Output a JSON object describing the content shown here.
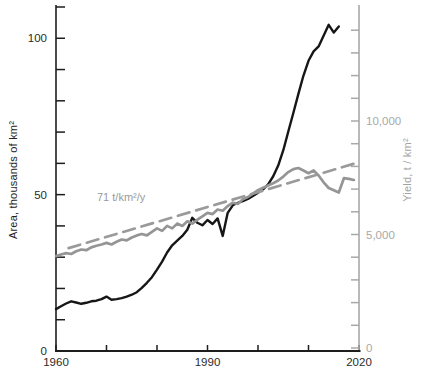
{
  "chart_data": {
    "type": "line",
    "title": "",
    "grid": false,
    "legend": "none",
    "annotation": {
      "text": "71 t/km²/y",
      "color": "#9a9a9a"
    },
    "x_axis": {
      "range": [
        1960,
        2020
      ],
      "tick_step": 10,
      "labeled_ticks": [
        1960,
        1990,
        2020
      ],
      "tick_labels": [
        "1960",
        "1990",
        "2020"
      ],
      "color": "#1d1d1d"
    },
    "left_axis": {
      "label": "Area, thousands of km²",
      "range": [
        0,
        110
      ],
      "tick_step": 10,
      "labeled_ticks": [
        0,
        50,
        100
      ],
      "tick_labels": [
        "0",
        "50",
        "100"
      ],
      "color": "#1d1d1d"
    },
    "right_axis": {
      "label": "Yield, t / km²",
      "range": [
        0,
        14000
      ],
      "tick_step": 1000,
      "labeled_ticks": [
        0,
        5000,
        10000
      ],
      "tick_labels": [
        "0",
        "5,000",
        "10,000"
      ],
      "color": "#a8a8a8"
    },
    "series": [
      {
        "name": "Area, thousands of km2",
        "axis": "left",
        "color": "#161616",
        "style": "solid",
        "width": 2.4,
        "points": [
          [
            1960,
            13.4
          ],
          [
            1961,
            14.3
          ],
          [
            1962,
            15.2
          ],
          [
            1963,
            15.9
          ],
          [
            1964,
            15.5
          ],
          [
            1965,
            15.1
          ],
          [
            1966,
            15.4
          ],
          [
            1967,
            15.9
          ],
          [
            1968,
            16.1
          ],
          [
            1969,
            16.6
          ],
          [
            1970,
            17.4
          ],
          [
            1971,
            16.4
          ],
          [
            1972,
            16.6
          ],
          [
            1973,
            16.9
          ],
          [
            1974,
            17.4
          ],
          [
            1975,
            18.0
          ],
          [
            1976,
            18.8
          ],
          [
            1977,
            20.2
          ],
          [
            1978,
            21.8
          ],
          [
            1979,
            23.6
          ],
          [
            1980,
            26.0
          ],
          [
            1981,
            28.6
          ],
          [
            1982,
            31.5
          ],
          [
            1983,
            33.8
          ],
          [
            1984,
            35.3
          ],
          [
            1985,
            36.8
          ],
          [
            1986,
            38.8
          ],
          [
            1987,
            42.6
          ],
          [
            1988,
            41.0
          ],
          [
            1989,
            40.2
          ],
          [
            1990,
            41.9
          ],
          [
            1991,
            40.6
          ],
          [
            1992,
            42.4
          ],
          [
            1993,
            36.8
          ],
          [
            1994,
            44.2
          ],
          [
            1995,
            46.6
          ],
          [
            1996,
            47.4
          ],
          [
            1997,
            47.9
          ],
          [
            1998,
            48.6
          ],
          [
            1999,
            49.6
          ],
          [
            2000,
            50.6
          ],
          [
            2001,
            51.7
          ],
          [
            2002,
            53.3
          ],
          [
            2003,
            55.8
          ],
          [
            2004,
            59.3
          ],
          [
            2005,
            64.2
          ],
          [
            2006,
            70.2
          ],
          [
            2007,
            76.2
          ],
          [
            2008,
            82.2
          ],
          [
            2009,
            88.0
          ],
          [
            2010,
            92.8
          ],
          [
            2011,
            95.8
          ],
          [
            2012,
            97.4
          ],
          [
            2013,
            100.8
          ],
          [
            2014,
            104.3
          ],
          [
            2015,
            101.8
          ],
          [
            2016,
            103.8
          ]
        ]
      },
      {
        "name": "Yield, t/km2",
        "axis": "right",
        "color": "#959595",
        "style": "solid",
        "width": 2.7,
        "points": [
          [
            1960,
            4050
          ],
          [
            1961,
            4120
          ],
          [
            1962,
            4180
          ],
          [
            1963,
            4140
          ],
          [
            1964,
            4260
          ],
          [
            1965,
            4340
          ],
          [
            1966,
            4310
          ],
          [
            1967,
            4430
          ],
          [
            1968,
            4500
          ],
          [
            1969,
            4560
          ],
          [
            1970,
            4630
          ],
          [
            1971,
            4560
          ],
          [
            1972,
            4680
          ],
          [
            1973,
            4780
          ],
          [
            1974,
            4740
          ],
          [
            1975,
            4870
          ],
          [
            1976,
            4960
          ],
          [
            1977,
            5020
          ],
          [
            1978,
            4960
          ],
          [
            1979,
            5120
          ],
          [
            1980,
            5270
          ],
          [
            1981,
            5160
          ],
          [
            1982,
            5380
          ],
          [
            1983,
            5270
          ],
          [
            1984,
            5480
          ],
          [
            1985,
            5380
          ],
          [
            1986,
            5580
          ],
          [
            1987,
            5480
          ],
          [
            1988,
            5650
          ],
          [
            1989,
            5800
          ],
          [
            1990,
            5950
          ],
          [
            1991,
            5900
          ],
          [
            1992,
            6100
          ],
          [
            1993,
            6050
          ],
          [
            1994,
            6250
          ],
          [
            1995,
            6400
          ],
          [
            1996,
            6350
          ],
          [
            1997,
            6550
          ],
          [
            1998,
            6650
          ],
          [
            1999,
            6800
          ],
          [
            2000,
            6950
          ],
          [
            2001,
            7060
          ],
          [
            2002,
            7160
          ],
          [
            2003,
            7260
          ],
          [
            2004,
            7380
          ],
          [
            2005,
            7550
          ],
          [
            2006,
            7750
          ],
          [
            2007,
            7880
          ],
          [
            2008,
            7930
          ],
          [
            2009,
            7820
          ],
          [
            2010,
            7700
          ],
          [
            2011,
            7820
          ],
          [
            2012,
            7600
          ],
          [
            2013,
            7300
          ],
          [
            2014,
            7050
          ],
          [
            2015,
            6950
          ],
          [
            2016,
            6850
          ],
          [
            2017,
            7480
          ],
          [
            2018,
            7450
          ],
          [
            2019,
            7400
          ]
        ]
      },
      {
        "name": "Yield linear trend (71 t/km2/y)",
        "axis": "right",
        "color": "#9a9a9a",
        "style": "dashed",
        "width": 2.7,
        "points": [
          [
            1962.5,
            4400
          ],
          [
            2019.5,
            8150
          ]
        ]
      }
    ]
  }
}
